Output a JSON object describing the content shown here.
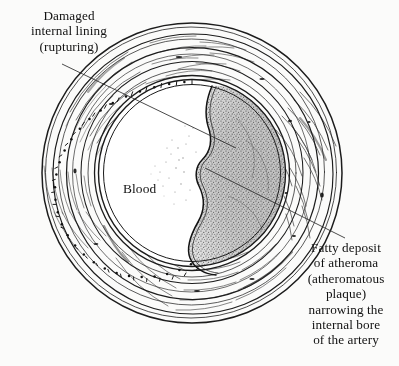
{
  "figure": {
    "background_color": "#fbfbfa",
    "ink_color": "#1a1a1a",
    "geometry": {
      "center_x": 192,
      "center_y": 173,
      "outer_radius": 150,
      "lumen_radius": 93
    }
  },
  "labels": {
    "damaged_lining": "Damaged\ninternal lining\n(rupturing)",
    "blood": "Blood",
    "fatty_deposit": "Fatty deposit\nof atheroma\n(atheromatous\nplaque)\nnarrowing the\ninternal bore\nof the artery"
  },
  "leader_lines": {
    "damaged_lining": {
      "x1": 62,
      "y1": 64,
      "x2": 236,
      "y2": 148
    },
    "fatty_deposit": {
      "x1": 345,
      "y1": 238,
      "x2": 205,
      "y2": 168
    }
  }
}
